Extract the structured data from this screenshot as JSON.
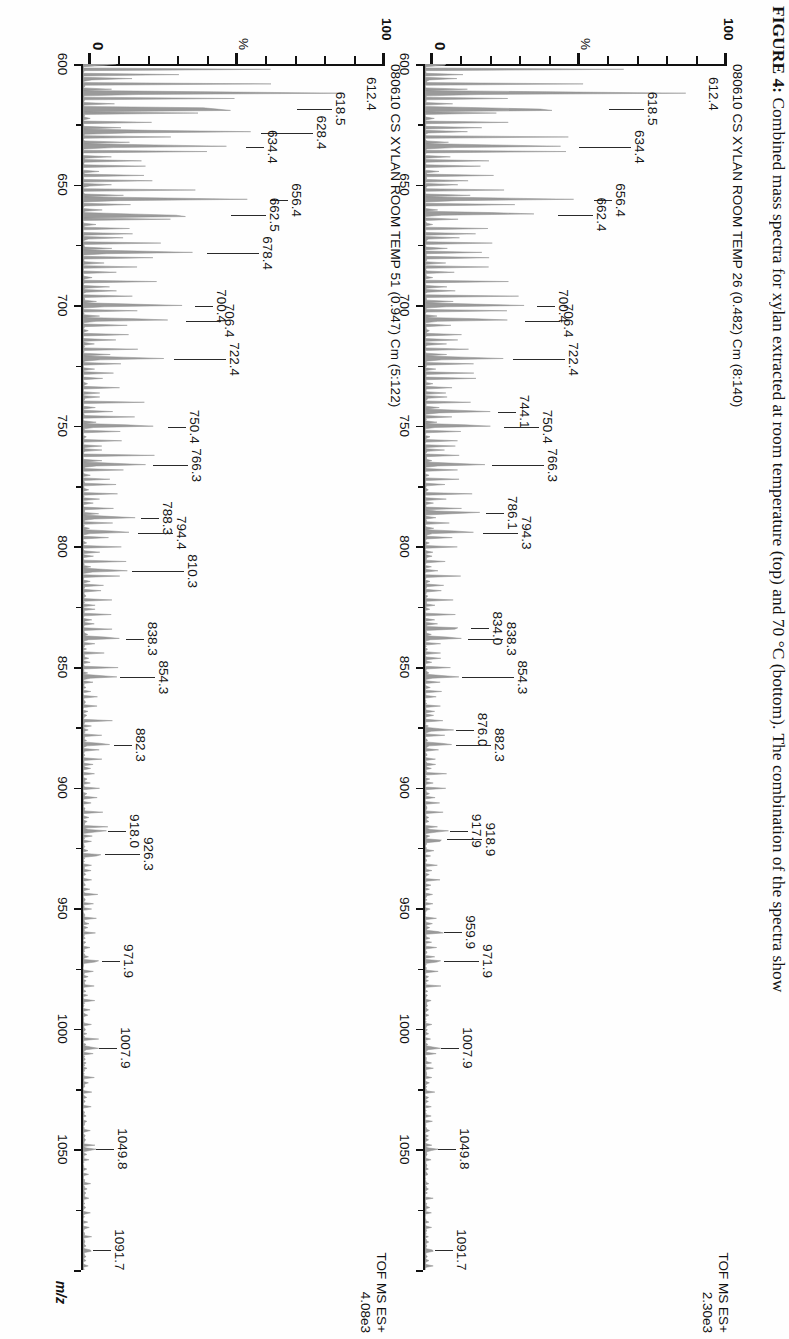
{
  "figure": {
    "caption_label": "FIGURE 4:",
    "caption_text": " Combined mass spectra for xylan extracted at room temperature (top) and 70 °C (bottom). The combination of the spectra show",
    "axis_title": "m/z"
  },
  "chart_data": {
    "type": "line",
    "title": "Combined mass spectra for xylan extracted at room temperature (top) and 70 °C (bottom)",
    "xlabel": "m/z",
    "ylabel": "%",
    "xlim": [
      600,
      1100
    ],
    "ylim": [
      0,
      100
    ],
    "grid": false,
    "legend": "none",
    "xticks": [
      600,
      650,
      700,
      750,
      800,
      850,
      900,
      950,
      1000,
      1050
    ],
    "yticks": [
      0,
      100
    ],
    "panels": [
      {
        "id": "top",
        "title": "080610 CS XYLAN ROOM TEMP 26 (0.482) Cm (8:140)",
        "acquisition": "TOF MS ES+",
        "intensity": "2.30e3",
        "y_top_label": "100",
        "y_mid_label": "%",
        "y_zero_label": "0",
        "base_peak": "612.4",
        "labels": [
          {
            "mz": "612.4",
            "x": 612.4,
            "y": 100
          },
          {
            "mz": "618.5",
            "x": 618.5,
            "y": 62
          },
          {
            "mz": "634.4",
            "x": 634.4,
            "y": 52
          },
          {
            "mz": "656.4",
            "x": 656.4,
            "y": 57
          },
          {
            "mz": "662.4",
            "x": 662.4,
            "y": 45
          },
          {
            "mz": "700.4",
            "x": 700.4,
            "y": 38
          },
          {
            "mz": "706.4",
            "x": 706.4,
            "y": 34
          },
          {
            "mz": "722.4",
            "x": 722.4,
            "y": 30
          },
          {
            "mz": "744.1",
            "x": 744.1,
            "y": 25
          },
          {
            "mz": "750.4",
            "x": 750.4,
            "y": 27
          },
          {
            "mz": "766.3",
            "x": 766.3,
            "y": 23
          },
          {
            "mz": "786.1",
            "x": 786.1,
            "y": 21
          },
          {
            "mz": "794.3",
            "x": 794.3,
            "y": 20
          },
          {
            "mz": "834.0",
            "x": 834.0,
            "y": 16
          },
          {
            "mz": "838.3",
            "x": 838.3,
            "y": 15
          },
          {
            "mz": "854.3",
            "x": 854.3,
            "y": 13
          },
          {
            "mz": "876.0",
            "x": 876.0,
            "y": 11
          },
          {
            "mz": "882.3",
            "x": 882.3,
            "y": 11
          },
          {
            "mz": "917.9",
            "x": 917.9,
            "y": 9
          },
          {
            "mz": "918.9",
            "x": 921.5,
            "y": 8
          },
          {
            "mz": "959.9",
            "x": 959.9,
            "y": 7
          },
          {
            "mz": "971.9",
            "x": 971.9,
            "y": 7
          },
          {
            "mz": "1007.9",
            "x": 1007.9,
            "y": 6
          },
          {
            "mz": "1049.8",
            "x": 1049.8,
            "y": 5
          },
          {
            "mz": "1091.7",
            "x": 1091.7,
            "y": 4
          }
        ]
      },
      {
        "id": "bottom",
        "title": "080610 CS XYLAN ROOM TEMP 51 (0.947) Cm (5:122)",
        "acquisition": "TOF MS ES+",
        "intensity": "4.08e3",
        "y_top_label": "100",
        "y_mid_label": "%",
        "y_zero_label": "0",
        "base_peak": "612.4",
        "labels": [
          {
            "mz": "612.4",
            "x": 612.4,
            "y": 100
          },
          {
            "mz": "618.5",
            "x": 618.5,
            "y": 72
          },
          {
            "mz": "628.4",
            "x": 628.4,
            "y": 60
          },
          {
            "mz": "634.4",
            "x": 634.4,
            "y": 55
          },
          {
            "mz": "656.4",
            "x": 656.4,
            "y": 63
          },
          {
            "mz": "662.5",
            "x": 662.5,
            "y": 50
          },
          {
            "mz": "678.4",
            "x": 678.4,
            "y": 42
          },
          {
            "mz": "700.4",
            "x": 700.4,
            "y": 38
          },
          {
            "mz": "706.4",
            "x": 706.4,
            "y": 35
          },
          {
            "mz": "722.4",
            "x": 722.4,
            "y": 31
          },
          {
            "mz": "750.4",
            "x": 750.4,
            "y": 29
          },
          {
            "mz": "766.3",
            "x": 766.3,
            "y": 24
          },
          {
            "mz": "788.3",
            "x": 788.3,
            "y": 20
          },
          {
            "mz": "794.4",
            "x": 794.4,
            "y": 19
          },
          {
            "mz": "810.3",
            "x": 810.3,
            "y": 17
          },
          {
            "mz": "838.3",
            "x": 838.3,
            "y": 15
          },
          {
            "mz": "854.3",
            "x": 854.3,
            "y": 13
          },
          {
            "mz": "882.3",
            "x": 882.3,
            "y": 11
          },
          {
            "mz": "918.0",
            "x": 918.0,
            "y": 9
          },
          {
            "mz": "926.3",
            "x": 927.5,
            "y": 8
          },
          {
            "mz": "971.9",
            "x": 971.9,
            "y": 7
          },
          {
            "mz": "1007.9",
            "x": 1007.9,
            "y": 6
          },
          {
            "mz": "1049.8",
            "x": 1049.8,
            "y": 5
          },
          {
            "mz": "1091.7",
            "x": 1091.7,
            "y": 4
          }
        ]
      }
    ]
  }
}
